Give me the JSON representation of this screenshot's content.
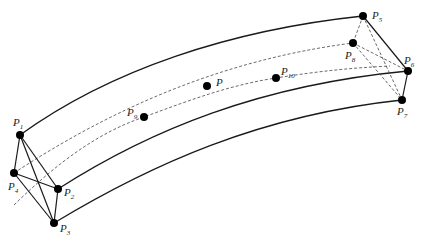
{
  "diagram": {
    "title": "",
    "points": [
      {
        "id": "P1",
        "label": "P",
        "sub": "1",
        "x": 20,
        "y": 135,
        "lx": 13,
        "ly": 126
      },
      {
        "id": "P2",
        "label": "P",
        "sub": "2",
        "x": 58,
        "y": 189,
        "lx": 64,
        "ly": 196
      },
      {
        "id": "P3",
        "label": "P",
        "sub": "3",
        "x": 54,
        "y": 223,
        "lx": 60,
        "ly": 232
      },
      {
        "id": "P4",
        "label": "P",
        "sub": "4",
        "x": 14,
        "y": 173,
        "lx": 8,
        "ly": 190
      },
      {
        "id": "P5",
        "label": "P",
        "sub": "5",
        "x": 363,
        "y": 16,
        "lx": 372,
        "ly": 19
      },
      {
        "id": "P6",
        "label": "P",
        "sub": "6",
        "x": 408,
        "y": 71,
        "lx": 404,
        "ly": 64
      },
      {
        "id": "P7",
        "label": "P",
        "sub": "7",
        "x": 402,
        "y": 100,
        "lx": 397,
        "ly": 115
      },
      {
        "id": "P8",
        "label": "P",
        "sub": "8",
        "x": 353,
        "y": 43,
        "lx": 345,
        "ly": 59
      },
      {
        "id": "P9",
        "label": "P",
        "sub": "9",
        "x": 144,
        "y": 117,
        "lx": 127,
        "ly": 116
      },
      {
        "id": "P10",
        "label": "P",
        "sub": "10",
        "x": 276,
        "y": 78,
        "lx": 281,
        "ly": 75
      },
      {
        "id": "P",
        "label": "P",
        "sub": "",
        "x": 207,
        "y": 86,
        "lx": 216,
        "ly": 86
      }
    ]
  }
}
